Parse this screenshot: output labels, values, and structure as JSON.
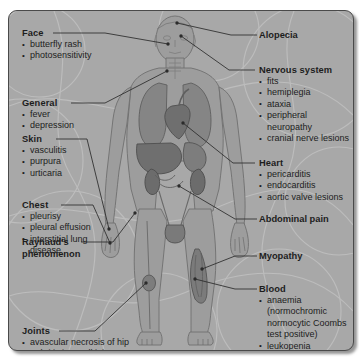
{
  "diagram": {
    "figure_alt": "anatomical-human-body-front-view"
  },
  "left_labels": [
    {
      "id": "face",
      "heading": "Face",
      "items": [
        "butterfly rash",
        "photosensitivity"
      ]
    },
    {
      "id": "general",
      "heading": "General",
      "items": [
        "fever",
        "depression"
      ]
    },
    {
      "id": "skin",
      "heading": "Skin",
      "items": [
        "vasculitis",
        "purpura",
        "urticaria"
      ]
    },
    {
      "id": "chest",
      "heading": "Chest",
      "items": [
        "pleurisy",
        "pleural effusion",
        "interstitial lung",
        "disease"
      ]
    },
    {
      "id": "raynauds",
      "heading": "Raynaud's",
      "items": [
        "phenomenon"
      ]
    },
    {
      "id": "joints",
      "heading": "Joints",
      "items": [
        "avascular necrosis of hip",
        "arthritis in small joints"
      ]
    }
  ],
  "right_labels": [
    {
      "id": "alopecia",
      "heading": "Alopecia",
      "items": []
    },
    {
      "id": "nervous-system",
      "heading": "Nervous system",
      "items": [
        "fits",
        "hemiplegia",
        "ataxia",
        "peripheral",
        "neuropathy",
        "cranial nerve lesions"
      ]
    },
    {
      "id": "heart",
      "heading": "Heart",
      "items": [
        "pericarditis",
        "endocarditis",
        "aortic valve lesions"
      ]
    },
    {
      "id": "abdominal-pain",
      "heading": "Abdominal pain",
      "items": []
    },
    {
      "id": "myopathy",
      "heading": "Myopathy",
      "items": []
    },
    {
      "id": "blood",
      "heading": "Blood",
      "items": [
        "anaemia",
        "(normochromic",
        "normocytic Coombs",
        "test positive)",
        "leukopenia",
        "thrombocytopenia"
      ]
    }
  ],
  "colors": {
    "panel_background": "#a9a9a9",
    "panel_border": "#4a4a4a",
    "text": "#1d1d1d",
    "leader_line": "#2b2b2b",
    "body_skin": "#9a9a9a",
    "body_outline": "#6d6d6d",
    "organ_dark": "#7a7a7a",
    "organ_mid": "#8b8b8b",
    "page_background": "#ffffff"
  }
}
